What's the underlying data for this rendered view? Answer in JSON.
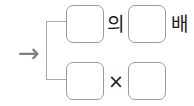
{
  "diagram": {
    "type": "korean-math-expression-template",
    "background_color": "#ffffff",
    "arrow": {
      "glyph": "→",
      "color": "#808080"
    },
    "bracket": {
      "shape": "left-square-bracket",
      "color": "#a8a8a8"
    },
    "box_style": {
      "border_color": "#9a9a9a",
      "fill_color": "#ffffff",
      "corner": "rounded"
    },
    "rows": [
      {
        "id": "row-top",
        "expression": "□의 □배",
        "boxes": [
          {
            "id": "box-1",
            "value": ""
          },
          {
            "id": "box-2",
            "value": ""
          }
        ],
        "operators": [
          {
            "id": "op-ui",
            "label": "의"
          },
          {
            "id": "op-bae",
            "label": "배"
          }
        ]
      },
      {
        "id": "row-bottom",
        "expression": "□ × □",
        "boxes": [
          {
            "id": "box-3",
            "value": ""
          },
          {
            "id": "box-4",
            "value": ""
          }
        ],
        "operators": [
          {
            "id": "op-times",
            "label": "×"
          }
        ]
      }
    ]
  }
}
